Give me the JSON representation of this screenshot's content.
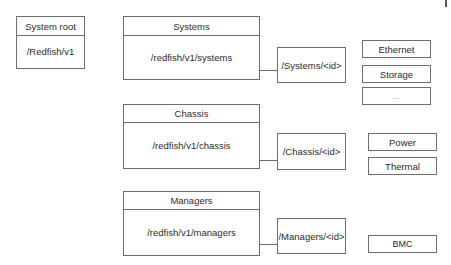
{
  "diagram": {
    "root": {
      "title": "System root",
      "path": "/Redfish/v1"
    },
    "collections": [
      {
        "title": "Systems",
        "path": "/redfish/v1/systems",
        "instance": "/Systems/<id>",
        "children": [
          "Ethernet",
          "Storage",
          "..."
        ]
      },
      {
        "title": "Chassis",
        "path": "/redfish/v1/chassis",
        "instance": "/Chassis/<id>",
        "children": [
          "Power",
          "Thermal"
        ]
      },
      {
        "title": "Managers",
        "path": "/redfish/v1/managers",
        "instance": "/Managers/<id>",
        "children": [
          "BMC"
        ]
      }
    ]
  },
  "colors": {
    "border": "#6e6e6e",
    "text": "#2b2b2b",
    "background": "#ffffff"
  }
}
